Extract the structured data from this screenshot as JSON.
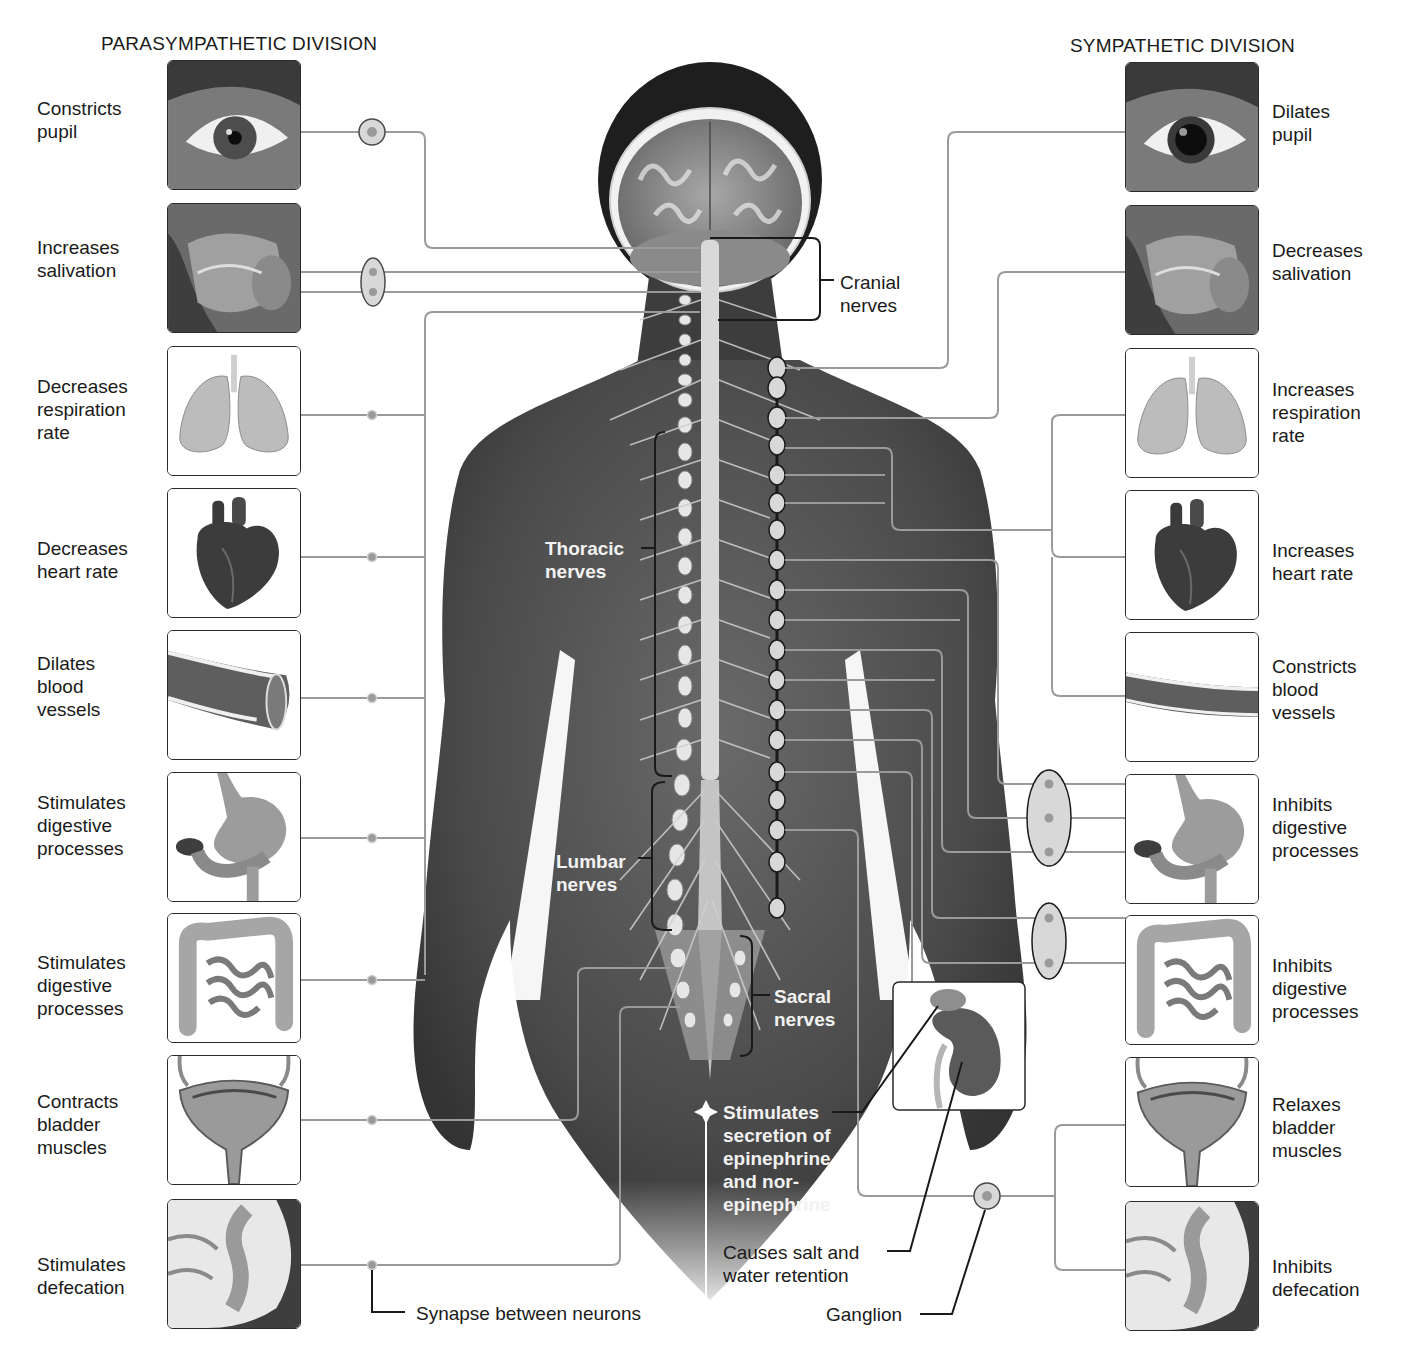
{
  "diagram": {
    "left_title": "PARASYMPATHETIC DIVISION",
    "right_title": "SYMPATHETIC DIVISION",
    "parasympathetic": [
      {
        "organ": "eye",
        "label": "Constricts\npupil"
      },
      {
        "organ": "salivary-glands",
        "label": "Increases\nsalivation"
      },
      {
        "organ": "lungs",
        "label": "Decreases\nrespiration\nrate"
      },
      {
        "organ": "heart",
        "label": "Decreases\nheart rate"
      },
      {
        "organ": "blood-vessel",
        "label": "Dilates\nblood\nvessels"
      },
      {
        "organ": "stomach",
        "label": "Stimulates\ndigestive\nprocesses"
      },
      {
        "organ": "intestines",
        "label": "Stimulates\ndigestive\nprocesses"
      },
      {
        "organ": "bladder",
        "label": "Contracts\nbladder\nmuscles"
      },
      {
        "organ": "rectum",
        "label": "Stimulates\ndefecation"
      }
    ],
    "sympathetic": [
      {
        "organ": "eye",
        "label": "Dilates\npupil"
      },
      {
        "organ": "salivary-glands",
        "label": "Decreases\nsalivation"
      },
      {
        "organ": "lungs",
        "label": "Increases\nrespiration\nrate"
      },
      {
        "organ": "heart",
        "label": "Increases\nheart rate"
      },
      {
        "organ": "blood-vessel",
        "label": "Constricts\nblood\nvessels"
      },
      {
        "organ": "stomach",
        "label": "Inhibits\ndigestive\nprocesses"
      },
      {
        "organ": "intestines",
        "label": "Inhibits\ndigestive\nprocesses"
      },
      {
        "organ": "bladder",
        "label": "Relaxes\nbladder\nmuscles"
      },
      {
        "organ": "rectum",
        "label": "Inhibits\ndefecation"
      }
    ],
    "nerve_groups": {
      "cranial": "Cranial\nnerves",
      "thoracic": "Thoracic\nnerves",
      "lumbar": "Lumbar\nnerves",
      "sacral": "Sacral\nnerves"
    },
    "annotations": {
      "adrenal": "Stimulates\nsecretion of\nepinephrine\nand nor-\nepinephrine",
      "kidney": "Causes salt and\nwater retention",
      "ganglion": "Ganglion",
      "synapse": "Synapse between neurons"
    },
    "colors": {
      "skin": "#4a4a4a",
      "line": "#9a9a9a",
      "ganglion_fill": "#d8d8d8",
      "text": "#1a1a1a"
    }
  }
}
